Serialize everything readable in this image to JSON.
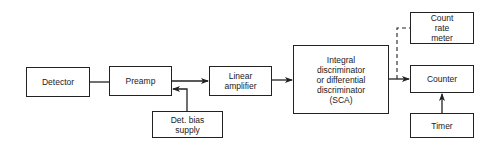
{
  "diagram": {
    "type": "block-diagram",
    "title": "",
    "nodes": [
      {
        "id": "detector",
        "label": "Detector"
      },
      {
        "id": "preamp",
        "label": "Preamp"
      },
      {
        "id": "linear_amplifier",
        "label_lines": [
          "Linear",
          "amplifier"
        ]
      },
      {
        "id": "det_bias_supply",
        "label_lines": [
          "Det. bias",
          "supply"
        ]
      },
      {
        "id": "sca",
        "label_lines": [
          "Integral",
          "discriminator",
          "or differential",
          "discriminator",
          "(SCA)"
        ]
      },
      {
        "id": "count_rate_meter",
        "label_lines": [
          "Count",
          "rate",
          "meter"
        ]
      },
      {
        "id": "counter",
        "label": "Counter"
      },
      {
        "id": "timer",
        "label": "Timer"
      }
    ],
    "edges": [
      {
        "from": "detector",
        "to": "preamp",
        "style": "solid",
        "arrow": false
      },
      {
        "from": "preamp",
        "to": "linear_amplifier",
        "style": "solid",
        "arrow": true
      },
      {
        "from": "det_bias_supply",
        "to": "preamp",
        "style": "solid",
        "arrow": true
      },
      {
        "from": "linear_amplifier",
        "to": "sca",
        "style": "solid",
        "arrow": true
      },
      {
        "from": "sca",
        "to": "counter",
        "style": "solid",
        "arrow": true
      },
      {
        "from": "sca",
        "to": "count_rate_meter",
        "style": "dashed",
        "arrow": false
      },
      {
        "from": "timer",
        "to": "counter",
        "style": "solid",
        "arrow": true
      }
    ]
  }
}
